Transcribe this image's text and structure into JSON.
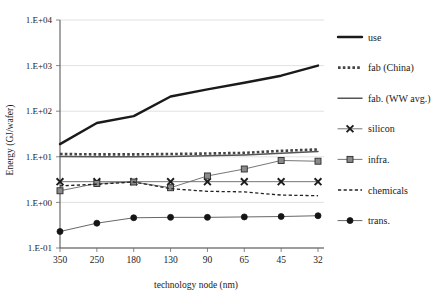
{
  "chart_data": {
    "type": "line",
    "title": "",
    "xlabel": "technology node (nm)",
    "ylabel": "Energy (GJ/wafer)",
    "categories": [
      "350",
      "250",
      "180",
      "130",
      "90",
      "65",
      "45",
      "32"
    ],
    "ytick_labels": [
      "1.E+04",
      "1.E+03",
      "1.E+02",
      "1.E+01",
      "1.E+00",
      "1.E-01"
    ],
    "ytick_values": [
      10000,
      1000,
      100,
      10,
      1,
      0.1
    ],
    "ylim": [
      0.1,
      10000
    ],
    "yscale": "log",
    "grid": true,
    "legend_position": "right",
    "series": [
      {
        "name": "use",
        "style": "solid-thick",
        "color": "#1a1a1a",
        "marker": "none",
        "values": [
          19,
          55,
          78,
          210,
          300,
          420,
          600,
          1000
        ]
      },
      {
        "name": "fab (China)",
        "style": "dotted-thick",
        "color": "#444444",
        "marker": "none",
        "values": [
          11.5,
          11.3,
          11.3,
          11.5,
          11.8,
          12.2,
          13.5,
          14.5
        ]
      },
      {
        "name": "fab. (WW avg.)",
        "style": "solid-medium",
        "color": "#555555",
        "marker": "none",
        "values": [
          10.2,
          10.0,
          10.0,
          10.2,
          10.5,
          11.0,
          12.0,
          13.0
        ]
      },
      {
        "name": "silicon",
        "style": "solid-thin",
        "color": "#666666",
        "marker": "x",
        "values": [
          2.85,
          2.85,
          2.85,
          2.85,
          2.85,
          2.85,
          2.85,
          2.85
        ]
      },
      {
        "name": "infra.",
        "style": "solid-thin",
        "color": "#666666",
        "marker": "square",
        "values": [
          1.8,
          2.6,
          2.8,
          2.1,
          3.8,
          5.4,
          8.3,
          8.0
        ]
      },
      {
        "name": "chemicals",
        "style": "dashed",
        "color": "#222222",
        "marker": "none",
        "values": [
          2.3,
          2.5,
          2.8,
          2.0,
          1.75,
          1.7,
          1.45,
          1.4
        ]
      },
      {
        "name": "trans.",
        "style": "solid-thin",
        "color": "#555555",
        "marker": "circle",
        "values": [
          0.23,
          0.35,
          0.46,
          0.47,
          0.47,
          0.48,
          0.49,
          0.51
        ]
      }
    ]
  },
  "legend": {
    "items": [
      {
        "label": "use",
        "key": "use"
      },
      {
        "label": "fab (China)",
        "key": "fab-china"
      },
      {
        "label": "fab. (WW avg.)",
        "key": "fab-ww"
      },
      {
        "label": "silicon",
        "key": "silicon"
      },
      {
        "label": "infra.",
        "key": "infra"
      },
      {
        "label": "chemicals",
        "key": "chemicals"
      },
      {
        "label": "trans.",
        "key": "trans"
      }
    ]
  },
  "colors": {
    "axis": "#4a4a4a",
    "grid": "#d9d9d9",
    "text": "#1a1a1a",
    "background": "#ffffff"
  }
}
